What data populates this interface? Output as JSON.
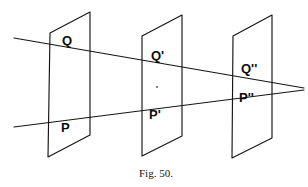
{
  "figure": {
    "caption": "Fig. 50.",
    "caption_x": 139,
    "caption_y": 168,
    "stroke_color": "#151515",
    "text_color": "#0b0b0b",
    "background_color": "#ffffff",
    "width": 308,
    "height": 187
  },
  "planes": [
    {
      "name": "plane-one",
      "label": "first plane",
      "points": "50,33 90,12 90,135 48,157"
    },
    {
      "name": "plane-two",
      "label": "second plane",
      "points": "142,36 182,15 182,136 142,156"
    },
    {
      "name": "plane-three",
      "label": "third plane",
      "points": "233,36 272,15 272,138 232,158"
    }
  ],
  "rays": [
    {
      "name": "ray-q",
      "label": "upper ray through Q, Q prime and Q double prime",
      "x1": 14,
      "y1": 38,
      "x2": 304,
      "y2": 88
    },
    {
      "name": "ray-p",
      "label": "lower ray through P, P prime and P double prime",
      "x1": 14,
      "y1": 127,
      "x2": 304,
      "y2": 90
    }
  ],
  "vanishing_point": {
    "name": "vanishing-point",
    "x": 304,
    "y": 89
  },
  "labels": [
    {
      "name": "label-q",
      "text": "Q",
      "x": 62,
      "y": 34
    },
    {
      "name": "label-p",
      "text": "P",
      "x": 61,
      "y": 121
    },
    {
      "name": "label-q-prime",
      "text": "Q'",
      "x": 151,
      "y": 49
    },
    {
      "name": "label-p-prime",
      "text": "P'",
      "x": 149,
      "y": 108
    },
    {
      "name": "label-q-dprime",
      "text": "Q''",
      "x": 241,
      "y": 62
    },
    {
      "name": "label-p-dprime",
      "text": "P''",
      "x": 239,
      "y": 91
    }
  ],
  "speck": {
    "name": "page-speck",
    "x": 156,
    "y": 86
  }
}
